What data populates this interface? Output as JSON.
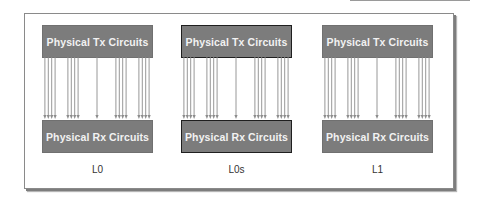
{
  "diagram": {
    "panels": [
      {
        "tx_label": "Physical Tx Circuits",
        "rx_label": "Physical Rx Circuits",
        "state_label": "L0",
        "highlighted": false
      },
      {
        "tx_label": "Physical Tx Circuits",
        "rx_label": "Physical Rx Circuits",
        "state_label": "L0s",
        "highlighted": true
      },
      {
        "tx_label": "Physical Tx Circuits",
        "rx_label": "Physical Rx Circuits",
        "state_label": "L1",
        "highlighted": false
      }
    ],
    "wire_groups": [
      4,
      4,
      1,
      4,
      4
    ],
    "colors": {
      "box_fill": "#7c7c7c",
      "box_text": "#f2f2f2",
      "wire": "#8c8c8c",
      "highlight_border": "#1f1f1f"
    }
  }
}
